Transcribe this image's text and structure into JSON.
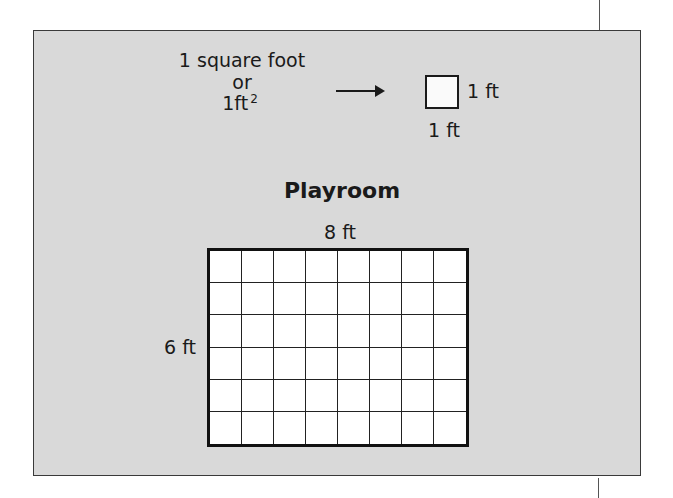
{
  "definition": {
    "line1": "1 square foot",
    "line2": "or",
    "line3_base": "1ft",
    "line3_exponent": "2",
    "arrow": "right-arrow",
    "unit_square": {
      "side_label_right": "1 ft",
      "side_label_bottom": "1 ft"
    }
  },
  "room": {
    "title": "Playroom",
    "width_label": "8 ft",
    "height_label": "6 ft",
    "columns": 8,
    "rows": 6
  },
  "colors": {
    "panel_background": "#d9d9d9",
    "grid_fill": "#ffffff",
    "line": "#111111"
  }
}
